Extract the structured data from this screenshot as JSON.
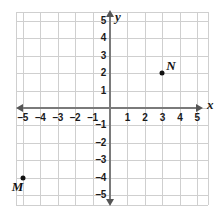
{
  "chart_data": {
    "type": "scatter",
    "title": "",
    "xlabel": "x",
    "ylabel": "y",
    "xlim": [
      -5.4,
      5.6
    ],
    "ylim": [
      -5.5,
      5.5
    ],
    "grid": true,
    "legend": "none",
    "x_ticks": [
      -5,
      -4,
      -3,
      -2,
      -1,
      1,
      2,
      3,
      4,
      5
    ],
    "y_ticks": [
      5,
      4,
      3,
      2,
      1,
      -1,
      -2,
      -3,
      -4,
      -5
    ],
    "x_tick_labels": [
      "–5",
      "–4",
      "–3",
      "–2",
      "–1",
      "1",
      "2",
      "3",
      "4",
      "5"
    ],
    "y_tick_labels": [
      "5",
      "4",
      "3",
      "2",
      "1",
      "–1",
      "–2",
      "–3",
      "–4",
      "–5"
    ],
    "points": [
      {
        "label": "M",
        "x": -5,
        "y": -4,
        "label_position": "left-below"
      },
      {
        "label": "N",
        "x": 3,
        "y": 2,
        "label_position": "right-above"
      }
    ],
    "colors": {
      "grid": "#cfcfcf",
      "axis": "#7a7a7a",
      "point": "#111111",
      "text": "#1a1a1a",
      "background": "#ffffff"
    }
  },
  "axis_labels": {
    "x": "x",
    "y": "y"
  }
}
